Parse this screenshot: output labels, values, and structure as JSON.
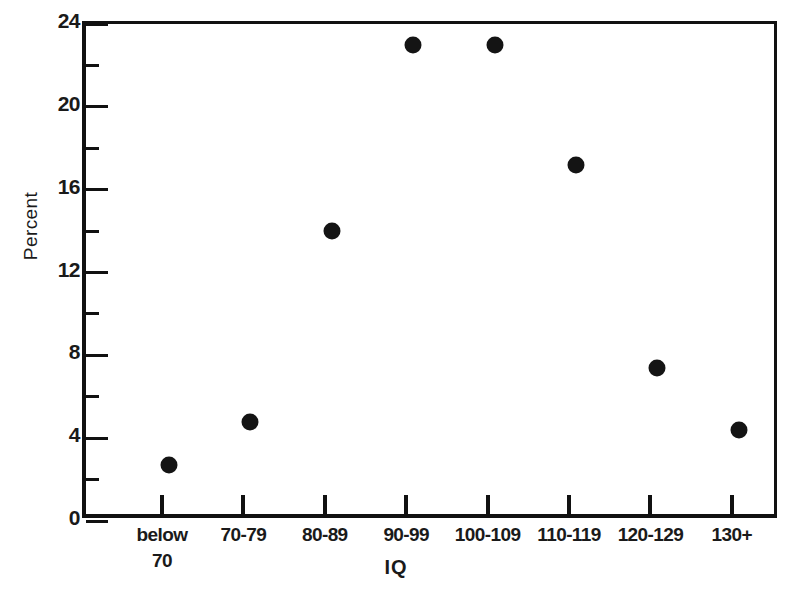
{
  "chart_data": {
    "type": "scatter",
    "title": "",
    "xlabel": "IQ",
    "ylabel": "Percent",
    "categories": [
      "below 70",
      "70-79",
      "80-89",
      "90-99",
      "100-109",
      "110-119",
      "120-129",
      "130+"
    ],
    "category_lines": [
      [
        "below",
        "70"
      ],
      [
        "70-79",
        ""
      ],
      [
        "80-89",
        ""
      ],
      [
        "90-99",
        ""
      ],
      [
        "100-109",
        ""
      ],
      [
        "110-119",
        ""
      ],
      [
        "120-129",
        ""
      ],
      [
        "130+",
        ""
      ]
    ],
    "values": [
      2.7,
      4.8,
      14.0,
      23.0,
      23.0,
      17.2,
      7.4,
      4.4
    ],
    "ylim": [
      0,
      24
    ],
    "y_major_ticks": [
      0,
      4,
      8,
      12,
      16,
      20,
      24
    ],
    "y_minor_ticks": [
      2,
      6,
      10,
      14,
      18,
      22
    ],
    "y_tick_labels": [
      "0",
      "4",
      "8",
      "12",
      "16",
      "20",
      "24"
    ],
    "grid": false,
    "legend": "none",
    "marker_color": "#141414",
    "axis_color": "#111111",
    "background_color": "#ffffff"
  }
}
